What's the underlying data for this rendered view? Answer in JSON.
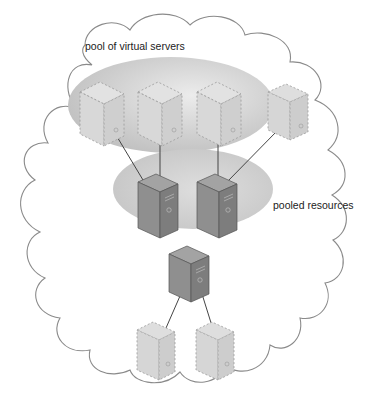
{
  "diagram": {
    "title_label": "pool of virtual servers",
    "pooled_label": "pooled resources",
    "colors": {
      "cloud_stroke": "#8a8a8a",
      "pool_ellipse": "#c8c8c8",
      "physical_server_front": "#8e8e8e",
      "physical_server_side": "#7a7a7a",
      "physical_server_top": "#a0a0a0",
      "virtual_server_fill": "#dcdcdc",
      "virtual_server_dash": "#9a9a9a",
      "connector": "#444444"
    },
    "virtual_servers_top": [
      {
        "id": "vs1",
        "in_pool": true
      },
      {
        "id": "vs2",
        "in_pool": true
      },
      {
        "id": "vs3",
        "in_pool": true
      },
      {
        "id": "vs4",
        "in_pool": false
      }
    ],
    "physical_servers_pooled": [
      {
        "id": "ps1"
      },
      {
        "id": "ps2"
      }
    ],
    "physical_server_standalone": {
      "id": "ps3"
    },
    "virtual_servers_bottom": [
      {
        "id": "vs5"
      },
      {
        "id": "vs6"
      }
    ]
  }
}
